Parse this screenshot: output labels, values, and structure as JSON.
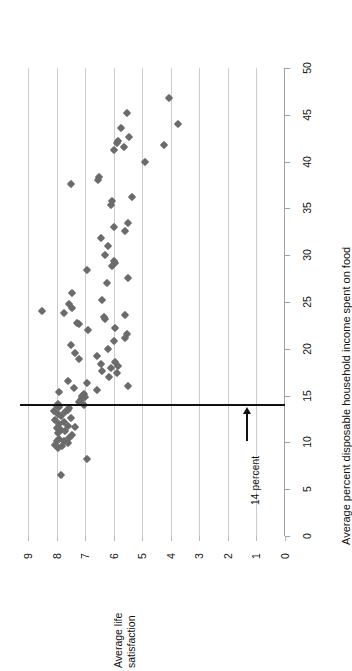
{
  "chart_data": {
    "type": "scatter",
    "title": "",
    "orientation": "rotated-90-clockwise",
    "xlabel": "Average percent disposable household income spent on food",
    "ylabel": "Average life satisfaction",
    "ylabel_lines": [
      "Average life",
      "satisfaction"
    ],
    "xlim": [
      0,
      50
    ],
    "ylim": [
      0,
      9
    ],
    "xticks": [
      0,
      5,
      10,
      15,
      20,
      25,
      30,
      35,
      40,
      45,
      50
    ],
    "yticks": [
      0,
      1,
      2,
      3,
      4,
      5,
      6,
      7,
      8,
      9
    ],
    "grid": "satisfaction-gridlines-only",
    "legend": "none",
    "marker": "diamond",
    "marker_color": "#6b6b6b",
    "annotations": [
      {
        "name": "threshold-14-percent",
        "label": "14 percent",
        "value": 14,
        "axis": "food",
        "style": "bold-horizontal-line-with-arrow",
        "color": "#111111"
      }
    ],
    "point_label_x": "food_percent",
    "point_label_y": "life_satisfaction",
    "points": [
      [
        6.5,
        7.85
      ],
      [
        8.2,
        6.95
      ],
      [
        9.4,
        7.95
      ],
      [
        9.6,
        7.8
      ],
      [
        9.7,
        8.05
      ],
      [
        9.9,
        7.6
      ],
      [
        10.1,
        8.0
      ],
      [
        10.2,
        7.75
      ],
      [
        10.4,
        7.9
      ],
      [
        10.5,
        7.55
      ],
      [
        10.8,
        7.45
      ],
      [
        11.0,
        7.95
      ],
      [
        11.2,
        7.7
      ],
      [
        11.3,
        7.85
      ],
      [
        11.5,
        8.0
      ],
      [
        11.6,
        7.35
      ],
      [
        11.8,
        7.6
      ],
      [
        12.0,
        7.9
      ],
      [
        12.2,
        7.75
      ],
      [
        12.4,
        8.05
      ],
      [
        12.6,
        7.5
      ],
      [
        12.8,
        7.85
      ],
      [
        13.0,
        7.95
      ],
      [
        13.2,
        7.7
      ],
      [
        13.4,
        8.1
      ],
      [
        13.5,
        7.6
      ],
      [
        13.7,
        7.55
      ],
      [
        13.8,
        7.9
      ],
      [
        13.9,
        8.0
      ],
      [
        14.0,
        7.05
      ],
      [
        14.1,
        7.95
      ],
      [
        14.3,
        7.2
      ],
      [
        14.5,
        7.15
      ],
      [
        14.7,
        7.1
      ],
      [
        14.9,
        7.0
      ],
      [
        15.0,
        7.12
      ],
      [
        15.2,
        7.05
      ],
      [
        15.4,
        7.9
      ],
      [
        15.6,
        6.6
      ],
      [
        15.8,
        7.4
      ],
      [
        16.0,
        5.5
      ],
      [
        16.3,
        6.95
      ],
      [
        16.6,
        7.6
      ],
      [
        17.0,
        6.15
      ],
      [
        17.4,
        5.9
      ],
      [
        17.6,
        6.4
      ],
      [
        17.9,
        6.1
      ],
      [
        18.2,
        5.85
      ],
      [
        18.4,
        6.45
      ],
      [
        18.6,
        5.95
      ],
      [
        18.9,
        7.2
      ],
      [
        19.2,
        6.6
      ],
      [
        19.6,
        7.35
      ],
      [
        20.0,
        6.2
      ],
      [
        20.4,
        7.5
      ],
      [
        20.8,
        6.0
      ],
      [
        21.2,
        5.6
      ],
      [
        21.6,
        5.55
      ],
      [
        22.0,
        6.9
      ],
      [
        22.2,
        5.95
      ],
      [
        22.6,
        7.2
      ],
      [
        22.8,
        7.3
      ],
      [
        23.2,
        6.3
      ],
      [
        23.4,
        6.35
      ],
      [
        23.6,
        5.6
      ],
      [
        23.8,
        7.75
      ],
      [
        24.0,
        8.5
      ],
      [
        24.4,
        7.45
      ],
      [
        24.8,
        7.55
      ],
      [
        25.2,
        6.4
      ],
      [
        26.0,
        7.45
      ],
      [
        27.0,
        6.25
      ],
      [
        27.6,
        5.5
      ],
      [
        28.4,
        6.95
      ],
      [
        28.8,
        6.05
      ],
      [
        29.2,
        5.95
      ],
      [
        29.4,
        6.0
      ],
      [
        30.0,
        6.3
      ],
      [
        31.0,
        6.2
      ],
      [
        31.8,
        6.45
      ],
      [
        32.6,
        5.6
      ],
      [
        33.0,
        6.0
      ],
      [
        33.4,
        5.5
      ],
      [
        35.4,
        6.1
      ],
      [
        35.8,
        6.05
      ],
      [
        36.2,
        5.35
      ],
      [
        37.6,
        7.5
      ],
      [
        38.0,
        6.55
      ],
      [
        38.4,
        6.5
      ],
      [
        40.0,
        4.9
      ],
      [
        41.2,
        6.0
      ],
      [
        41.6,
        5.65
      ],
      [
        41.8,
        4.25
      ],
      [
        42.0,
        5.9
      ],
      [
        42.2,
        5.85
      ],
      [
        42.6,
        5.45
      ],
      [
        43.6,
        5.75
      ],
      [
        44.0,
        3.75
      ],
      [
        45.2,
        5.55
      ],
      [
        46.8,
        4.05
      ]
    ]
  }
}
